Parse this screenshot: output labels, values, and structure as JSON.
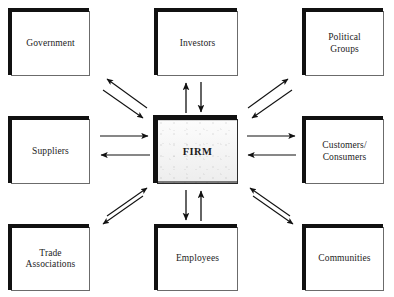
{
  "diagram": {
    "type": "hub-and-spoke stakeholder map",
    "center": {
      "id": "firm",
      "label": "FIRM"
    },
    "stakeholders": [
      {
        "id": "government",
        "label": "Government",
        "position": "top-left"
      },
      {
        "id": "investors",
        "label": "Investors",
        "position": "top-center"
      },
      {
        "id": "political-groups",
        "label": "Political\nGroups",
        "position": "top-right"
      },
      {
        "id": "suppliers",
        "label": "Suppliers",
        "position": "middle-left"
      },
      {
        "id": "customers",
        "label": "Customers/\nConsumers",
        "position": "middle-right"
      },
      {
        "id": "trade-associations",
        "label": "Trade\nAssociations",
        "position": "bottom-left"
      },
      {
        "id": "employees",
        "label": "Employees",
        "position": "bottom-center"
      },
      {
        "id": "communities",
        "label": "Communities",
        "position": "bottom-right"
      }
    ],
    "connections": [
      {
        "between": [
          "firm",
          "government"
        ],
        "direction": "bidirectional",
        "style": "diagonal-pair"
      },
      {
        "between": [
          "firm",
          "investors"
        ],
        "direction": "bidirectional",
        "style": "vertical-pair"
      },
      {
        "between": [
          "firm",
          "political-groups"
        ],
        "direction": "bidirectional",
        "style": "diagonal-pair"
      },
      {
        "between": [
          "firm",
          "suppliers"
        ],
        "direction": "bidirectional",
        "style": "horizontal-pair"
      },
      {
        "between": [
          "firm",
          "customers"
        ],
        "direction": "bidirectional",
        "style": "horizontal-pair"
      },
      {
        "between": [
          "firm",
          "trade-associations"
        ],
        "direction": "bidirectional",
        "style": "diagonal-pair"
      },
      {
        "between": [
          "firm",
          "employees"
        ],
        "direction": "bidirectional",
        "style": "vertical-pair"
      },
      {
        "between": [
          "firm",
          "communities"
        ],
        "direction": "bidirectional",
        "style": "diagonal-pair"
      }
    ],
    "colors": {
      "background": "#ffffff",
      "box_border": "#6b6b6b",
      "box_shadow": "#111111",
      "text": "#1c1c1c",
      "arrow": "#111111",
      "center_fill": "#f2f2f2"
    }
  }
}
